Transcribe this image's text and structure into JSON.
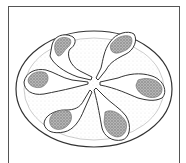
{
  "image": {
    "subject": "Illustration of six lamb chops arranged in a pinwheel on an oval platter",
    "colors": {
      "line": "#333333",
      "meat": "#8a8a8a",
      "background": "#ffffff",
      "frame": "#555555"
    }
  }
}
